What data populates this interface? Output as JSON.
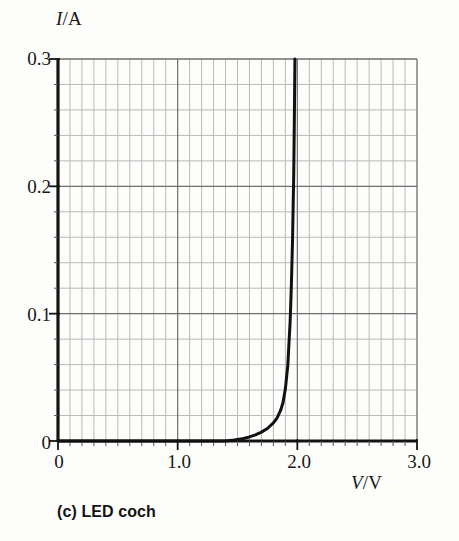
{
  "figure": {
    "caption": "(c) LED coch",
    "background_color": "#fdfdfb",
    "ink_color": "#131313"
  },
  "axes": {
    "y_axis_label_symbol": "I",
    "y_axis_label_unit": "/A",
    "x_axis_label_symbol": "V",
    "x_axis_label_unit": "/V",
    "y_ticks": [
      "0",
      "0.1",
      "0.2",
      "0.3"
    ],
    "x_ticks": [
      "0",
      "1.0",
      "2.0",
      "3.0"
    ]
  },
  "chart_data": {
    "type": "line",
    "title": "(c) LED coch",
    "xlabel": "V/V",
    "ylabel": "I/A",
    "xlim": [
      0,
      3.0
    ],
    "ylim": [
      0,
      0.3
    ],
    "grid": true,
    "grid_major_x_step": 1.0,
    "grid_major_y_step": 0.1,
    "grid_minor_x_step": 0.1,
    "grid_minor_y_step": 0.02,
    "legend": null,
    "line_color": "#111111",
    "line_width_px": 3,
    "series": [
      {
        "name": "LED coch (red LED) I-V characteristic",
        "x": [
          0.0,
          0.1,
          0.2,
          0.3,
          0.4,
          0.5,
          0.6,
          0.7,
          0.8,
          0.9,
          1.0,
          1.1,
          1.2,
          1.3,
          1.4,
          1.45,
          1.5,
          1.55,
          1.6,
          1.65,
          1.7,
          1.75,
          1.8,
          1.83,
          1.86,
          1.88,
          1.9,
          1.92,
          1.94,
          1.95,
          1.96,
          1.97,
          1.975,
          1.98
        ],
        "y": [
          0.0,
          0.0,
          0.0,
          0.0,
          0.0,
          0.0,
          0.0,
          0.0,
          0.0,
          0.0,
          0.0,
          0.0,
          0.0,
          0.0,
          0.0,
          0.0005,
          0.0012,
          0.002,
          0.0032,
          0.0048,
          0.007,
          0.0098,
          0.0142,
          0.018,
          0.024,
          0.03,
          0.041,
          0.059,
          0.094,
          0.122,
          0.158,
          0.21,
          0.252,
          0.3
        ]
      }
    ],
    "annotations": []
  }
}
